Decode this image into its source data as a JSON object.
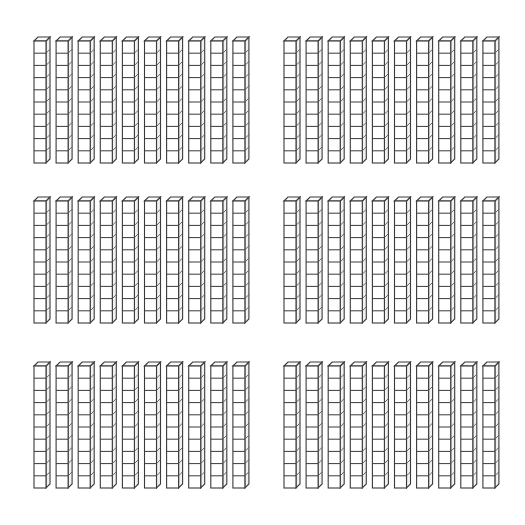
{
  "diagram": {
    "type": "base-ten-blocks",
    "total_groups": 6,
    "rods_per_group": 10,
    "cubes_per_rod": 10,
    "total_rods": 60,
    "total_value": 600,
    "colors": {
      "background": "#ffffff",
      "stroke": "#3a3a3a",
      "face_front": "#ffffff",
      "face_side": "#f2f2f2",
      "face_top": "#fafafa"
    },
    "geometry": {
      "cube_width": 12,
      "cube_height": 12.2,
      "depth_x": 4,
      "depth_y": 4,
      "rod_pitch": 22.1
    },
    "groups": [
      {
        "id": "group-1",
        "row": 1,
        "col": 1,
        "x": 34,
        "y": 41,
        "rods": 10,
        "cubes_per_rod": 10
      },
      {
        "id": "group-2",
        "row": 1,
        "col": 2,
        "x": 284,
        "y": 41,
        "rods": 10,
        "cubes_per_rod": 10
      },
      {
        "id": "group-3",
        "row": 2,
        "col": 1,
        "x": 34,
        "y": 201,
        "rods": 10,
        "cubes_per_rod": 10
      },
      {
        "id": "group-4",
        "row": 2,
        "col": 2,
        "x": 284,
        "y": 201,
        "rods": 10,
        "cubes_per_rod": 10
      },
      {
        "id": "group-5",
        "row": 3,
        "col": 1,
        "x": 34,
        "y": 366,
        "rods": 10,
        "cubes_per_rod": 10
      },
      {
        "id": "group-6",
        "row": 3,
        "col": 2,
        "x": 284,
        "y": 366,
        "rods": 10,
        "cubes_per_rod": 10
      }
    ]
  }
}
